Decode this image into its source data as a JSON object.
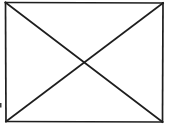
{
  "figure": {
    "canvas": {
      "width": 174,
      "height": 134,
      "background_color": "#ffffff"
    },
    "style": {
      "stroke_color": "#1e1e1e",
      "stroke_width": 1.7,
      "fill": "none"
    },
    "corners": {
      "top_left": {
        "x": 5.5,
        "y": 2.5
      },
      "top_right": {
        "x": 163,
        "y": 3
      },
      "bottom_right": {
        "x": 162.5,
        "y": 122
      },
      "bottom_left": {
        "x": 6,
        "y": 121.5
      }
    },
    "center_crossing": {
      "x": 84,
      "y": 62
    },
    "lines": [
      {
        "name": "top-edge",
        "from": "top_left",
        "to": "top_right"
      },
      {
        "name": "right-edge",
        "from": "top_right",
        "to": "bottom_right"
      },
      {
        "name": "bottom-edge",
        "from": "bottom_right",
        "to": "bottom_left"
      },
      {
        "name": "left-edge",
        "from": "bottom_left",
        "to": "top_left"
      },
      {
        "name": "diagonal-tl-br",
        "from": "top_left",
        "to": "bottom_right"
      },
      {
        "name": "diagonal-tr-bl",
        "from": "top_right",
        "to": "bottom_left"
      }
    ],
    "artifacts": [
      {
        "name": "left-edge-speck",
        "x": 0,
        "y": 103,
        "width": 1.5,
        "height": 4.5,
        "color": "#3a3a3a"
      }
    ]
  }
}
